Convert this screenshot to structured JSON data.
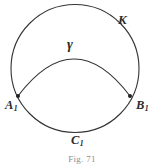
{
  "figure": {
    "caption": "Fig. 71",
    "background_color": "#ffffff",
    "stroke_color": "#333333",
    "label_color": "#2b2b2b",
    "width": 164,
    "height": 164
  },
  "labels": {
    "circle": {
      "text": "K",
      "name": "circle-label-K",
      "description": "label of the large circle"
    },
    "arc": {
      "text": "γ",
      "name": "arc-label-gamma",
      "description": "label of the upper lens arc"
    },
    "point_left": {
      "letter": "A",
      "subscript": "1",
      "name": "point-label-A1"
    },
    "point_right": {
      "letter": "B",
      "subscript": "1",
      "name": "point-label-B1"
    },
    "arc_bottom": {
      "letter": "C",
      "subscript": "1",
      "name": "arc-label-C1"
    }
  },
  "geometry": {
    "circle": {
      "cx": 75,
      "cy": 68.5,
      "r": 64,
      "stroke_width": 1.1
    },
    "chord_arc": {
      "start_x": 18,
      "start_y": 96,
      "end_x": 130,
      "end_y": 96,
      "apex_y": 59,
      "stroke_width": 1.1
    },
    "points": [
      {
        "name": "A1",
        "x": 18,
        "y": 96,
        "radius": 2.0
      },
      {
        "name": "B1",
        "x": 130,
        "y": 96,
        "radius": 2.0
      }
    ]
  }
}
